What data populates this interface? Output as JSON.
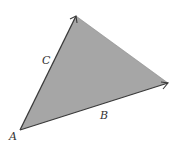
{
  "diagram": {
    "type": "vector-triangle",
    "fill_color": "#a6a6a6",
    "stroke_color": "#3a3a3a",
    "vertices": {
      "A": [
        20,
        130
      ],
      "top": [
        76,
        16
      ],
      "right": [
        168,
        83
      ]
    },
    "labels": {
      "A": "A",
      "B": "B",
      "C": "C"
    },
    "vectors": [
      {
        "name": "C",
        "from": "A",
        "to": "top"
      },
      {
        "name": "B",
        "from": "A",
        "to": "right"
      }
    ]
  }
}
